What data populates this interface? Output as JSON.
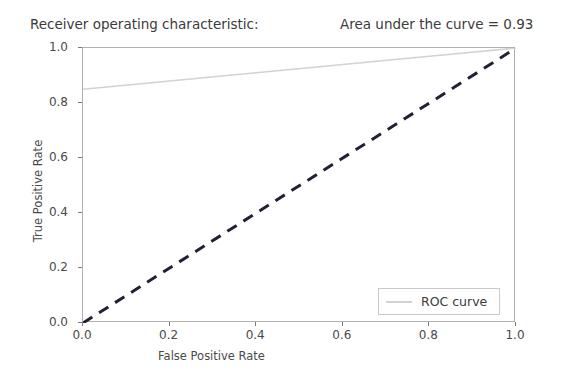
{
  "figure": {
    "width": 575,
    "height": 382,
    "background": "#ffffff"
  },
  "title": {
    "left_text": "Receiver operating characteristic:",
    "right_text": "Area under the curve = 0.93"
  },
  "legend": {
    "entries": [
      {
        "label": "ROC curve",
        "color": "#d2d2d2",
        "style": "solid"
      }
    ],
    "position": "lower-right"
  },
  "chart_data": {
    "type": "line",
    "title": "Receiver operating characteristic:",
    "annotation": "Area under the curve = 0.93",
    "auc": 0.93,
    "xlabel": "False Positive Rate",
    "ylabel": "True Positive Rate",
    "xlim": [
      0.0,
      1.0
    ],
    "ylim": [
      0.0,
      1.0
    ],
    "xticks": [
      0.0,
      0.2,
      0.4,
      0.6,
      0.8,
      1.0
    ],
    "yticks": [
      0.0,
      0.2,
      0.4,
      0.6,
      0.8,
      1.0
    ],
    "xtick_labels": [
      "0.0",
      "0.2",
      "0.4",
      "0.6",
      "0.8",
      "1.0"
    ],
    "ytick_labels": [
      "0.0",
      "0.2",
      "0.4",
      "0.6",
      "0.8",
      "1.0"
    ],
    "grid": false,
    "legend_position": "lower right",
    "series": [
      {
        "name": "ROC curve",
        "color": "#d2d2d2",
        "linestyle": "solid",
        "linewidth": 1.6,
        "x": [
          0.0,
          0.2,
          0.4,
          0.6,
          0.8,
          1.0
        ],
        "y": [
          0.85,
          0.88,
          0.91,
          0.94,
          0.97,
          1.0
        ]
      },
      {
        "name": "chance diagonal",
        "color": "#1f2233",
        "linestyle": "dashed",
        "linewidth": 3.0,
        "x": [
          0.0,
          1.0
        ],
        "y": [
          0.0,
          1.0
        ]
      }
    ]
  },
  "axis_style": {
    "spine_color": "#b0b0b0",
    "tick_color": "#7a7a7a",
    "label_color": "#4a4a4a",
    "title_color": "#3b3b3b"
  }
}
